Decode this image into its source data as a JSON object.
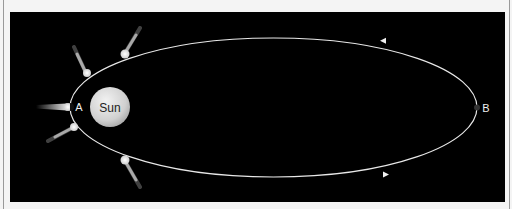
{
  "diagram": {
    "type": "comet orbit around the Sun",
    "background_color": "#000000",
    "orbit_color": "#e8e8e8",
    "sun": {
      "label": "Sun",
      "color": "#d8d8d8"
    },
    "points": [
      {
        "id": "A",
        "label": "A",
        "meaning": "perihelion"
      },
      {
        "id": "B",
        "label": "B",
        "meaning": "aphelion"
      }
    ],
    "comet_positions": 5,
    "direction": "counterclockwise arrows: top arrow points left, bottom arrow points right"
  }
}
